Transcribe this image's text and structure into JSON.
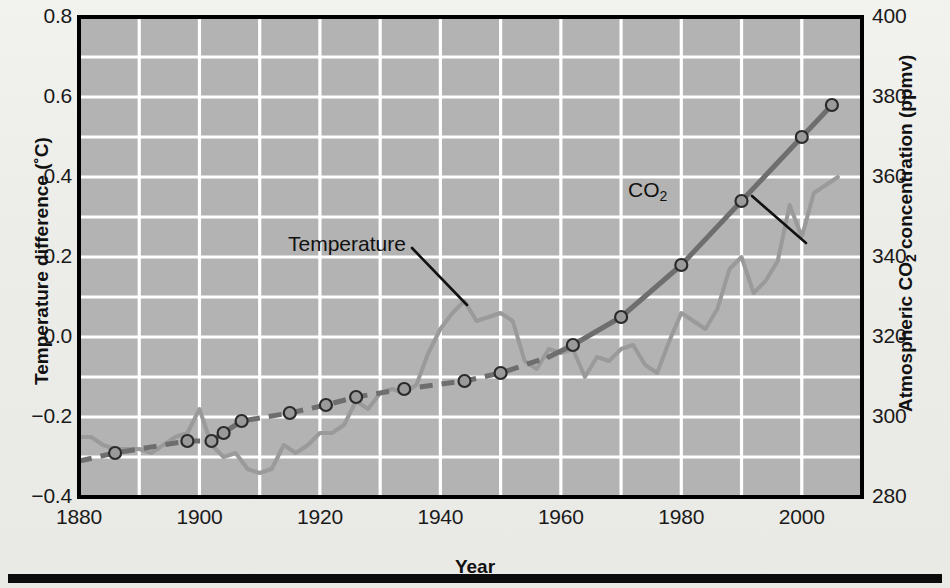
{
  "figure": {
    "background_color": "#ecece8",
    "plot_background_color": "#b3b3b3",
    "grid_color": "#ffffff",
    "axis_color": "#000000"
  },
  "axes": {
    "x": {
      "title": "Year",
      "min": 1880,
      "max": 2010,
      "tick_values": [
        1880,
        1900,
        1920,
        1940,
        1960,
        1980,
        2000
      ],
      "tick_labels": [
        "1880",
        "1900",
        "1920",
        "1940",
        "1960",
        "1980",
        "2000"
      ],
      "minor_tick_step": 10
    },
    "y_left": {
      "title": "Temperature difference (˚C)",
      "min": -0.4,
      "max": 0.8,
      "tick_values": [
        -0.4,
        -0.2,
        0.0,
        0.2,
        0.4,
        0.6,
        0.8
      ],
      "tick_labels": [
        "−0.4",
        "−0.2",
        "0.0",
        "0.2",
        "0.4",
        "0.6",
        "0.8"
      ],
      "minor_tick_step": 0.1
    },
    "y_right": {
      "title": "Atmospheric CO2 concentration (ppmv)",
      "title_main": "Atmospheric CO",
      "title_sub": "2",
      "title_tail": " concentration (ppmv)",
      "min": 280,
      "max": 400,
      "tick_values": [
        280,
        300,
        320,
        340,
        360,
        380,
        400
      ],
      "tick_labels": [
        "280",
        "300",
        "320",
        "340",
        "360",
        "380",
        "400"
      ],
      "minor_tick_step": 10
    }
  },
  "annotations": [
    {
      "name": "co2-annotation",
      "text_main": "CO",
      "text_sub": "2",
      "leader_from": [
        752,
        196
      ],
      "leader_to": [
        806,
        243
      ]
    },
    {
      "name": "temperature-annotation",
      "text_main": "Temperature",
      "text_sub": "",
      "leader_from": [
        412,
        248
      ],
      "leader_to": [
        467,
        305
      ]
    }
  ],
  "chart_data": {
    "type": "line",
    "title": "",
    "xlabel": "Year",
    "ylabel": "Temperature difference (˚C)",
    "ylabel_right": "Atmospheric CO2 concentration (ppmv)",
    "xlim": [
      1880,
      2010
    ],
    "ylim": [
      -0.4,
      0.8
    ],
    "ylim_right": [
      280,
      400
    ],
    "grid": true,
    "legend": "inline-annotations",
    "series": [
      {
        "name": "Temperature",
        "axis": "left",
        "style": "solid",
        "color": "#9a9a9a",
        "line_width": 4,
        "units": "˚C",
        "x": [
          1880,
          1882,
          1884,
          1886,
          1888,
          1890,
          1892,
          1894,
          1896,
          1898,
          1900,
          1902,
          1904,
          1906,
          1908,
          1910,
          1912,
          1914,
          1916,
          1918,
          1920,
          1922,
          1924,
          1926,
          1928,
          1930,
          1932,
          1934,
          1936,
          1938,
          1940,
          1942,
          1944,
          1946,
          1948,
          1950,
          1952,
          1954,
          1956,
          1958,
          1960,
          1962,
          1964,
          1966,
          1968,
          1970,
          1972,
          1974,
          1976,
          1978,
          1980,
          1982,
          1984,
          1986,
          1988,
          1990,
          1992,
          1994,
          1996,
          1998,
          2000,
          2002,
          2004,
          2006
        ],
        "y": [
          -0.25,
          -0.25,
          -0.27,
          -0.28,
          -0.28,
          -0.28,
          -0.29,
          -0.27,
          -0.25,
          -0.24,
          -0.18,
          -0.27,
          -0.3,
          -0.29,
          -0.33,
          -0.34,
          -0.33,
          -0.27,
          -0.29,
          -0.27,
          -0.24,
          -0.24,
          -0.22,
          -0.16,
          -0.18,
          -0.14,
          -0.13,
          -0.14,
          -0.12,
          -0.04,
          0.02,
          0.06,
          0.09,
          0.04,
          0.05,
          0.06,
          0.04,
          -0.06,
          -0.08,
          -0.03,
          -0.04,
          -0.03,
          -0.1,
          -0.05,
          -0.06,
          -0.03,
          -0.02,
          -0.07,
          -0.09,
          -0.01,
          0.06,
          0.04,
          0.02,
          0.07,
          0.17,
          0.2,
          0.11,
          0.14,
          0.19,
          0.33,
          0.25,
          0.36,
          0.38,
          0.4
        ]
      },
      {
        "name": "CO2",
        "axis": "right",
        "style": "dashed-then-solid",
        "solid_from_year": 1958,
        "color": "#6e6e6e",
        "line_width": 5,
        "units": "ppmv",
        "x": [
          1880,
          1886,
          1898,
          1902,
          1904,
          1907,
          1915,
          1921,
          1926,
          1934,
          1944,
          1950,
          1958,
          1962,
          1970,
          1980,
          1990,
          2000,
          2005
        ],
        "y": [
          289,
          291,
          294,
          294,
          296,
          299,
          301,
          303,
          305,
          307,
          309,
          311,
          315,
          318,
          325,
          338,
          354,
          370,
          378
        ],
        "markers": {
          "shape": "circle",
          "radius": 6,
          "fill": "#9a9a9a",
          "edge": "#2a2a2a",
          "points": [
            {
              "x": 1886,
              "y": 291
            },
            {
              "x": 1898,
              "y": 294
            },
            {
              "x": 1902,
              "y": 294
            },
            {
              "x": 1904,
              "y": 296
            },
            {
              "x": 1907,
              "y": 299
            },
            {
              "x": 1915,
              "y": 301
            },
            {
              "x": 1921,
              "y": 303
            },
            {
              "x": 1926,
              "y": 305
            },
            {
              "x": 1934,
              "y": 307
            },
            {
              "x": 1944,
              "y": 309
            },
            {
              "x": 1950,
              "y": 311
            },
            {
              "x": 1962,
              "y": 318
            },
            {
              "x": 1970,
              "y": 325
            },
            {
              "x": 1980,
              "y": 338
            },
            {
              "x": 1990,
              "y": 354
            },
            {
              "x": 2000,
              "y": 370
            },
            {
              "x": 2005,
              "y": 378
            }
          ]
        }
      }
    ]
  }
}
